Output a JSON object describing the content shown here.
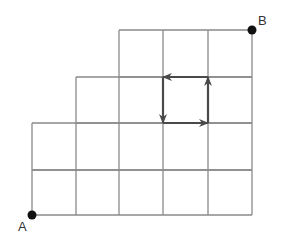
{
  "diagram": {
    "type": "staircase-grid-path",
    "points": {
      "start": {
        "label": "A",
        "x": 32,
        "y": 215
      },
      "end": {
        "label": "B",
        "x": 252,
        "y": 30
      }
    },
    "grid": {
      "columns_x": [
        32,
        76,
        119,
        163,
        208,
        252
      ],
      "rows_y": [
        30,
        77,
        123,
        170,
        215
      ],
      "rows": [
        {
          "row": 1,
          "from_x": 32,
          "to_x": 252,
          "cells": 5
        },
        {
          "row": 2,
          "from_x": 32,
          "to_x": 252,
          "cells": 5
        },
        {
          "row": 3,
          "from_x": 76,
          "to_x": 252,
          "cells": 4
        },
        {
          "row": 4,
          "from_x": 119,
          "to_x": 252,
          "cells": 3
        }
      ],
      "line_color": "#8a8a8a"
    },
    "loop_arrows": {
      "color": "#4a4a4a",
      "direction": "counterclockwise",
      "segments": [
        {
          "name": "right",
          "from": [
            163,
            123
          ],
          "to": [
            208,
            123
          ]
        },
        {
          "name": "up",
          "from": [
            208,
            123
          ],
          "to": [
            208,
            77
          ]
        },
        {
          "name": "left",
          "from": [
            208,
            77
          ],
          "to": [
            163,
            77
          ]
        },
        {
          "name": "down",
          "from": [
            163,
            77
          ],
          "to": [
            163,
            123
          ]
        }
      ]
    }
  }
}
